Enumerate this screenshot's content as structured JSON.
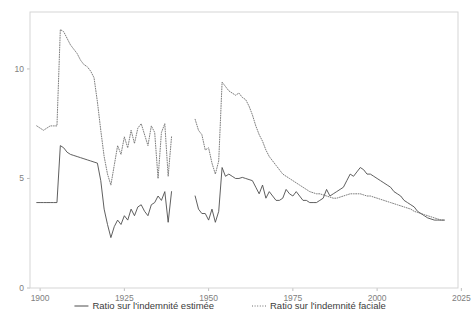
{
  "chart_data": {
    "type": "line",
    "title": "",
    "xlabel": "",
    "ylabel": "",
    "xlim": [
      1897,
      2024
    ],
    "ylim": [
      0,
      12.6
    ],
    "grid": false,
    "legend_position": "bottom",
    "xticks": [
      1900,
      1925,
      1950,
      1975,
      2000,
      2025
    ],
    "xtick_labels": [
      "1900",
      "1925",
      "1950",
      "1975",
      "2000",
      "2025"
    ],
    "yticks": [
      0,
      5,
      10
    ],
    "ytick_labels": [
      "0",
      "5",
      "10"
    ],
    "series": [
      {
        "name": "Ratio sur l'indemnité estimée",
        "style": "solid",
        "color": "#4d4d4d",
        "x": [
          1899,
          1900,
          1901,
          1902,
          1903,
          1904,
          1905,
          1906,
          1907,
          1908,
          1909,
          1910,
          1911,
          1912,
          1913,
          1914,
          1915,
          1916,
          1917,
          1918,
          1919,
          1920,
          1921,
          1922,
          1923,
          1924,
          1925,
          1926,
          1927,
          1928,
          1929,
          1930,
          1931,
          1932,
          1933,
          1934,
          1935,
          1936,
          1937,
          1938,
          1939,
          1946,
          1947,
          1948,
          1949,
          1950,
          1951,
          1952,
          1953,
          1954,
          1955,
          1956,
          1957,
          1958,
          1959,
          1960,
          1961,
          1962,
          1963,
          1964,
          1965,
          1966,
          1967,
          1968,
          1969,
          1970,
          1971,
          1972,
          1973,
          1974,
          1975,
          1976,
          1977,
          1978,
          1979,
          1980,
          1981,
          1982,
          1983,
          1984,
          1985,
          1986,
          1987,
          1988,
          1989,
          1990,
          1991,
          1992,
          1993,
          1994,
          1995,
          1996,
          1997,
          1998,
          1999,
          2000,
          2001,
          2002,
          2003,
          2004,
          2005,
          2006,
          2007,
          2008,
          2009,
          2010,
          2011,
          2012,
          2013,
          2014,
          2015,
          2016,
          2017,
          2018,
          2019,
          2020
        ],
        "y": [
          3.9,
          3.9,
          3.9,
          3.9,
          3.9,
          3.9,
          3.9,
          6.5,
          6.4,
          6.2,
          6.1,
          6.05,
          6.0,
          5.95,
          5.9,
          5.85,
          5.8,
          5.75,
          5.7,
          4.9,
          3.6,
          2.9,
          2.3,
          2.8,
          3.1,
          2.9,
          3.3,
          3.1,
          3.6,
          3.3,
          3.7,
          3.8,
          3.5,
          3.3,
          3.8,
          3.9,
          4.2,
          4.0,
          4.4,
          3.0,
          4.4,
          4.2,
          3.6,
          3.4,
          3.4,
          3.1,
          3.6,
          3.0,
          3.5,
          5.5,
          5.1,
          5.2,
          5.1,
          5.0,
          5.0,
          5.05,
          5.0,
          4.95,
          4.9,
          4.6,
          4.3,
          4.7,
          4.1,
          4.4,
          4.2,
          4.0,
          4.0,
          4.1,
          4.5,
          4.3,
          4.2,
          4.4,
          4.2,
          4.0,
          4.0,
          3.9,
          3.9,
          3.9,
          4.0,
          4.1,
          4.5,
          4.2,
          4.3,
          4.4,
          4.5,
          4.6,
          4.9,
          5.2,
          5.1,
          5.3,
          5.5,
          5.4,
          5.2,
          5.2,
          5.1,
          5.0,
          4.9,
          4.8,
          4.7,
          4.6,
          4.4,
          4.3,
          4.2,
          4.0,
          3.9,
          3.8,
          3.7,
          3.5,
          3.4,
          3.3,
          3.2,
          3.15,
          3.1,
          3.1,
          3.1,
          3.1
        ]
      },
      {
        "name": "Ratio sur l'indemnité faciale",
        "style": "dotted",
        "color": "#6e6e6e",
        "x": [
          1899,
          1900,
          1901,
          1902,
          1903,
          1904,
          1905,
          1906,
          1907,
          1908,
          1909,
          1910,
          1911,
          1912,
          1913,
          1914,
          1915,
          1916,
          1917,
          1918,
          1919,
          1920,
          1921,
          1922,
          1923,
          1924,
          1925,
          1926,
          1927,
          1928,
          1929,
          1930,
          1931,
          1932,
          1933,
          1934,
          1935,
          1936,
          1937,
          1938,
          1939,
          1946,
          1947,
          1948,
          1949,
          1950,
          1951,
          1952,
          1953,
          1954,
          1955,
          1956,
          1957,
          1958,
          1959,
          1960,
          1961,
          1962,
          1963,
          1964,
          1965,
          1966,
          1967,
          1968,
          1969,
          1970,
          1971,
          1972,
          1973,
          1974,
          1975,
          1976,
          1977,
          1978,
          1979,
          1980,
          1981,
          1982,
          1983,
          1984,
          1985,
          1986,
          1987,
          1988,
          1989,
          1990,
          1991,
          1992,
          1993,
          1994,
          1995,
          1996,
          1997,
          1998,
          1999,
          2000,
          2001,
          2002,
          2003,
          2004,
          2005,
          2006,
          2007,
          2008,
          2009,
          2010,
          2011,
          2012,
          2013,
          2014,
          2015,
          2016,
          2017,
          2018,
          2019,
          2020
        ],
        "y": [
          7.4,
          7.3,
          7.2,
          7.3,
          7.4,
          7.4,
          7.4,
          11.8,
          11.7,
          11.4,
          11.1,
          10.9,
          10.7,
          10.4,
          10.2,
          10.1,
          9.9,
          9.6,
          8.5,
          7.2,
          6.0,
          5.2,
          4.7,
          5.6,
          6.5,
          6.1,
          6.9,
          6.4,
          7.2,
          6.6,
          7.3,
          7.5,
          7.0,
          6.5,
          7.4,
          7.1,
          5.0,
          7.1,
          7.5,
          5.1,
          6.9,
          7.7,
          7.2,
          7.0,
          6.3,
          6.4,
          5.7,
          5.2,
          5.8,
          9.4,
          9.2,
          9.0,
          8.9,
          8.8,
          8.9,
          8.7,
          8.6,
          8.3,
          7.9,
          7.4,
          7.0,
          6.7,
          6.3,
          6.0,
          5.8,
          5.6,
          5.4,
          5.2,
          5.1,
          5.0,
          4.9,
          4.8,
          4.7,
          4.6,
          4.5,
          4.4,
          4.35,
          4.3,
          4.3,
          4.25,
          4.2,
          4.15,
          4.1,
          4.1,
          4.15,
          4.2,
          4.25,
          4.3,
          4.3,
          4.3,
          4.3,
          4.25,
          4.2,
          4.2,
          4.15,
          4.1,
          4.05,
          4.0,
          3.95,
          3.9,
          3.85,
          3.8,
          3.75,
          3.7,
          3.65,
          3.6,
          3.5,
          3.45,
          3.4,
          3.35,
          3.3,
          3.25,
          3.2,
          3.15,
          3.1,
          3.1
        ]
      }
    ],
    "gap_years": [
      1940,
      1945
    ]
  },
  "legend": {
    "items": [
      {
        "label": "Ratio sur l'indemnité estimée",
        "style": "solid"
      },
      {
        "label": "Ratio sur l'indemnité faciale",
        "style": "dotted"
      }
    ]
  }
}
